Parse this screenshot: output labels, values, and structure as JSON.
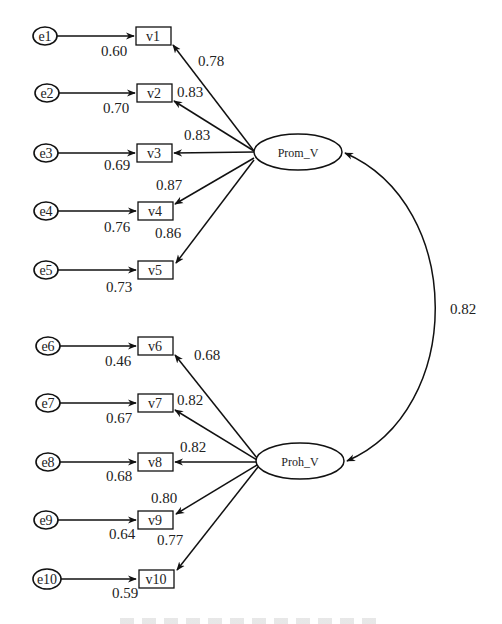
{
  "diagram": {
    "type": "confirmatory factor analysis path diagram",
    "latent_factors": [
      {
        "id": "prom",
        "label": "Prom_V"
      },
      {
        "id": "proh",
        "label": "Proh_V"
      }
    ],
    "factor_correlation": {
      "from": "Prom_V",
      "to": "Proh_V",
      "value": "0.82"
    },
    "indicators": [
      {
        "error": "e1",
        "var": "v1",
        "r2": "0.60",
        "loading": "0.78",
        "factor": "Prom_V"
      },
      {
        "error": "e2",
        "var": "v2",
        "r2": "0.70",
        "loading": "0.83",
        "factor": "Prom_V"
      },
      {
        "error": "e3",
        "var": "v3",
        "r2": "0.69",
        "loading": "0.83",
        "factor": "Prom_V"
      },
      {
        "error": "e4",
        "var": "v4",
        "r2": "0.76",
        "loading": "0.87",
        "factor": "Prom_V"
      },
      {
        "error": "e5",
        "var": "v5",
        "r2": "0.73",
        "loading": "0.86",
        "factor": "Prom_V"
      },
      {
        "error": "e6",
        "var": "v6",
        "r2": "0.46",
        "loading": "0.68",
        "factor": "Proh_V"
      },
      {
        "error": "e7",
        "var": "v7",
        "r2": "0.67",
        "loading": "0.82",
        "factor": "Proh_V"
      },
      {
        "error": "e8",
        "var": "v8",
        "r2": "0.68",
        "loading": "0.82",
        "factor": "Proh_V"
      },
      {
        "error": "e9",
        "var": "v9",
        "r2": "0.64",
        "loading": "0.80",
        "factor": "Proh_V"
      },
      {
        "error": "e10",
        "var": "v10",
        "r2": "0.59",
        "loading": "0.77",
        "factor": "Proh_V"
      }
    ]
  }
}
